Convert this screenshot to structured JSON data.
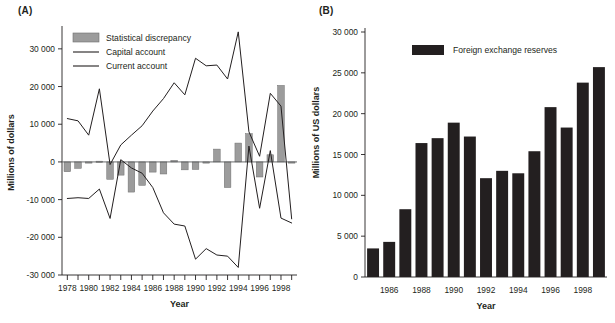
{
  "figure": {
    "panel_a_tag": "(A)",
    "panel_b_tag": "(B)"
  },
  "chart_data": [
    {
      "id": "panel-a",
      "type": "bar",
      "title": "(A)",
      "xlabel": "Year",
      "ylabel": "Millions of dollars",
      "ylim": [
        -30000,
        35000
      ],
      "ytick_values": [
        30000,
        20000,
        10000,
        0,
        -10000,
        -20000,
        -30000
      ],
      "ytick_labels": [
        "30 000",
        "20 000",
        "10 000",
        "0",
        "-10 000",
        "-20 000",
        "-30 000"
      ],
      "xlim": [
        1977.5,
        1999.5
      ],
      "xtick_values": [
        1978,
        1979,
        1980,
        1981,
        1982,
        1983,
        1984,
        1985,
        1986,
        1987,
        1988,
        1989,
        1990,
        1991,
        1992,
        1993,
        1994,
        1995,
        1996,
        1997,
        1998,
        1999
      ],
      "xtick_labels_shown": [
        {
          "value": 1978,
          "label": "1978"
        },
        {
          "value": 1980,
          "label": "1980"
        },
        {
          "value": 1982,
          "label": "1982"
        },
        {
          "value": 1984,
          "label": "1984"
        },
        {
          "value": 1986,
          "label": "1986"
        },
        {
          "value": 1988,
          "label": "1988"
        },
        {
          "value": 1990,
          "label": "1990"
        },
        {
          "value": 1992,
          "label": "1992"
        },
        {
          "value": 1994,
          "label": "1994"
        },
        {
          "value": 1996,
          "label": "1996"
        },
        {
          "value": 1998,
          "label": "1998"
        }
      ],
      "grid": false,
      "legend_position": "top-left",
      "legend": [
        {
          "label": "Statistical discrepancy",
          "marker": "bar",
          "color": "#9c9c9c"
        },
        {
          "label": "Capital account",
          "marker": "line",
          "color": "#231f20"
        },
        {
          "label": "Current account",
          "marker": "line",
          "color": "#231f20"
        }
      ],
      "categories": [
        1978,
        1979,
        1980,
        1981,
        1982,
        1983,
        1984,
        1985,
        1986,
        1987,
        1988,
        1989,
        1990,
        1991,
        1992,
        1993,
        1994,
        1995,
        1996,
        1997,
        1998,
        1999
      ],
      "bars": {
        "name": "Statistical discrepancy",
        "color": "#9c9c9c",
        "values": [
          -2600,
          -1700,
          -200,
          200,
          -4600,
          -3500,
          -8000,
          -6200,
          -2700,
          -3200,
          400,
          -2100,
          -2000,
          -200,
          3400,
          -6800,
          5000,
          7500,
          -4000,
          1900,
          20300,
          -200
        ]
      },
      "series": [
        {
          "name": "Capital account",
          "color": "#231f20",
          "x": [
            1978,
            1979,
            1980,
            1981,
            1982,
            1983,
            1984,
            1985,
            1986,
            1987,
            1988,
            1989,
            1990,
            1991,
            1992,
            1993,
            1994,
            1995,
            1996,
            1997,
            1998,
            1999
          ],
          "values": [
            -9700,
            -9500,
            -9700,
            -7200,
            -15000,
            600,
            -1600,
            -3000,
            -6800,
            -13500,
            -16500,
            -17000,
            -25800,
            -23000,
            -24700,
            -25000,
            -28000,
            4200,
            -12300,
            3000,
            -14900,
            -16200
          ]
        },
        {
          "name": "Current account",
          "color": "#231f20",
          "x": [
            1978,
            1979,
            1980,
            1981,
            1982,
            1983,
            1984,
            1985,
            1986,
            1987,
            1988,
            1989,
            1990,
            1991,
            1992,
            1993,
            1994,
            1995,
            1996,
            1997,
            1998,
            1999
          ],
          "values": [
            11500,
            10900,
            7100,
            19400,
            -700,
            4500,
            7100,
            9600,
            13500,
            16800,
            21000,
            17800,
            27500,
            25500,
            25700,
            22000,
            34500,
            8000,
            1500,
            18200,
            14800,
            -15100
          ]
        }
      ]
    },
    {
      "id": "panel-b",
      "type": "bar",
      "title": "(B)",
      "xlabel": "Year",
      "ylabel": "Millions of US dollars",
      "ylim": [
        0,
        30000
      ],
      "ytick_values": [
        30000,
        25000,
        20000,
        15000,
        10000,
        5000,
        0
      ],
      "ytick_labels": [
        "30 000",
        "25 000",
        "20 000",
        "15 000",
        "10 000",
        "5 000",
        "0"
      ],
      "xtick_labels_shown": [
        {
          "value": 1986,
          "label": "1986"
        },
        {
          "value": 1988,
          "label": "1988"
        },
        {
          "value": 1990,
          "label": "1990"
        },
        {
          "value": 1992,
          "label": "1992"
        },
        {
          "value": 1994,
          "label": "1994"
        },
        {
          "value": 1996,
          "label": "1996"
        },
        {
          "value": 1998,
          "label": "1998"
        }
      ],
      "grid": false,
      "legend_position": "top-center",
      "legend": [
        {
          "label": "Foreign exchange reserves",
          "marker": "bar",
          "color": "#231f20"
        }
      ],
      "categories": [
        1985,
        1986,
        1987,
        1988,
        1989,
        1990,
        1991,
        1992,
        1993,
        1994,
        1995,
        1996,
        1997,
        1998,
        1999
      ],
      "bars": {
        "name": "Foreign exchange reserves",
        "color": "#231f20",
        "values": [
          3500,
          4300,
          8300,
          16400,
          17000,
          18900,
          17200,
          12100,
          13000,
          12700,
          15400,
          20800,
          18300,
          23800,
          25700
        ]
      }
    }
  ]
}
